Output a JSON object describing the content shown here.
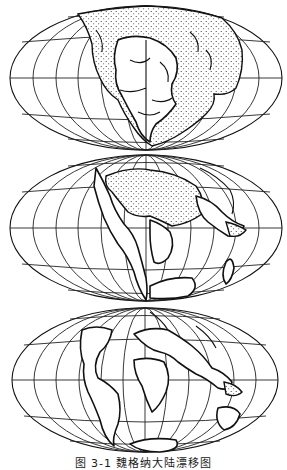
{
  "figure": {
    "caption": "图 3-1   魏格纳大陆漂移图",
    "projection": "elliptical equal-area (Mollweide-style) world map",
    "graticule": {
      "meridian_spacing_deg": 30,
      "parallel_spacing_deg": 30
    },
    "panels": [
      {
        "id": "top",
        "label": "Late Carboniferous (Pangaea)",
        "shading": "dotted shallow seas",
        "center_x": 146,
        "center_y": 78,
        "rx": 136,
        "ry": 72
      },
      {
        "id": "middle",
        "label": "Eocene",
        "shading": "dotted shallow seas",
        "center_x": 146,
        "center_y": 228,
        "rx": 136,
        "ry": 73
      },
      {
        "id": "bottom",
        "label": "Early Quaternary",
        "shading": "minimal",
        "center_x": 145,
        "center_y": 380,
        "rx": 133,
        "ry": 72
      }
    ],
    "colors": {
      "ink": "#111111",
      "background": "#ffffff"
    }
  }
}
